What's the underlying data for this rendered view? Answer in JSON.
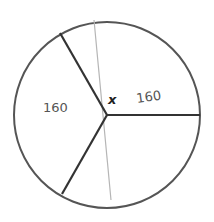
{
  "diagram": {
    "type": "circle-sectors",
    "labels": {
      "left_sector": "160",
      "upper_right_sector": "160",
      "unknown_angle": "x"
    },
    "colors": {
      "stroke": "#333333",
      "faint_line": "#b5b5b5",
      "background": "#ffffff"
    }
  }
}
